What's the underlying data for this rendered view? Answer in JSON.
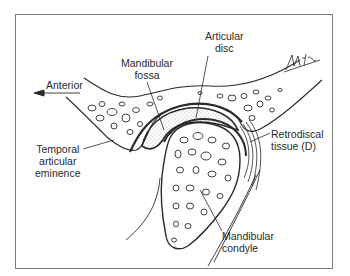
{
  "figure": {
    "labels": {
      "articular_disc": [
        "Articular",
        "disc"
      ],
      "mandibular_fossa": [
        "Mandibular",
        "fossa"
      ],
      "anterior": "Anterior",
      "retrodiscal_tissue": [
        "Retrodiscal",
        "tissue (D)"
      ],
      "temporal_articular_eminence": [
        "Temporal",
        "articular",
        "eminence"
      ],
      "mandibular_condyle": [
        "Mandibular",
        "condyle"
      ]
    },
    "signature": "BMISTC",
    "colors": {
      "line": "#2a2a2a",
      "frame": "#7a7a7a",
      "background": "#ffffff",
      "stipple": "#555555"
    }
  }
}
